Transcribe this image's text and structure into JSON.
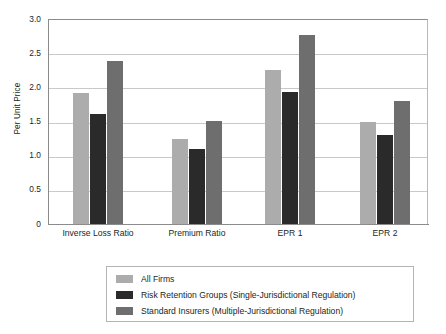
{
  "chart_data": {
    "type": "bar",
    "title": "",
    "subtitle": "",
    "xlabel": "",
    "ylabel": "Per Unit Price",
    "ylim": [
      0,
      3.0
    ],
    "ytick_labels": [
      "3.0",
      "2.5",
      "2.0",
      "1.5",
      "1.0",
      "0.5",
      "0"
    ],
    "ytick_values": [
      3.0,
      2.5,
      2.0,
      1.5,
      1.0,
      0.5,
      0
    ],
    "grid": "horizontal",
    "legend_position": "below-center",
    "categories": [
      "Inverse Loss Ratio",
      "Premium Ratio",
      "EPR 1",
      "EPR 2"
    ],
    "series": [
      {
        "name": "All Firms",
        "color": "#acacac",
        "values": [
          1.91,
          1.25,
          2.25,
          1.49
        ]
      },
      {
        "name": "Risk Retention Groups (Single-Jurisdictional Regulation)",
        "color": "#2a2a2a",
        "values": [
          1.61,
          1.1,
          1.93,
          1.3
        ]
      },
      {
        "name": "Standard Insurers (Multiple-Jurisdictional Regulation)",
        "color": "#6e6e6e",
        "values": [
          2.38,
          1.51,
          2.77,
          1.8
        ]
      }
    ]
  },
  "axis": {
    "y_title": "Per Unit Price"
  }
}
